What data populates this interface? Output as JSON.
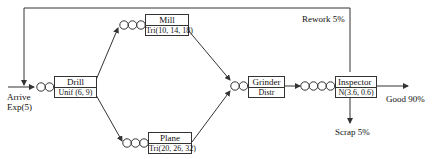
{
  "diagram": {
    "type": "queueing-network",
    "arrival": {
      "label": "Arrive",
      "dist": "Exp(5)"
    },
    "stations": [
      {
        "id": "drill",
        "name": "Drill",
        "dist": "Unif (6, 9)",
        "queue_circles": 2
      },
      {
        "id": "mill",
        "name": "Mill",
        "dist": "Tri(10, 14, 18)",
        "queue_circles": 3
      },
      {
        "id": "plane",
        "name": "Plane",
        "dist": "Tri(20, 26, 32)",
        "queue_circles": 3
      },
      {
        "id": "grinder",
        "name": "Grinder",
        "dist": "Distr",
        "queue_circles": 2
      },
      {
        "id": "inspector",
        "name": "Inspector",
        "dist": "N(3.6, 0.6)",
        "queue_circles": 4
      }
    ],
    "outcomes": {
      "rework": "Rework 5%",
      "good": "Good 90%",
      "scrap": "Scrap 5%"
    },
    "colors": {
      "line": "#333333",
      "text": "#111111",
      "background": "#ffffff"
    }
  }
}
